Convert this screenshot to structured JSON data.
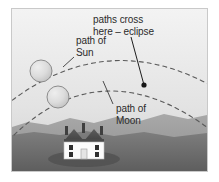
{
  "figure": {
    "title_hidden": "",
    "background_color": "#ffffff",
    "frame_border_color": "#c9c9c9"
  },
  "labels": {
    "eclipse_line1": "paths cross",
    "eclipse_line2": "here – eclipse",
    "sun_line1": "path of",
    "sun_line2": "Sun",
    "moon_line1": "path of",
    "moon_line2": "Moon"
  },
  "scene": {
    "sky_top_color": "#efefef",
    "sky_bottom_color": "#d8d8d8",
    "hills_color": "#9a9a9a",
    "ground_color": "#6f6f6f",
    "house_wall_color": "#fbfbfb",
    "house_roof_color": "#4e4e4e",
    "body_fill_color": "#d6d6d6",
    "body_stroke_color": "#8c8c8c",
    "path_stroke_color": "#5a5a5a",
    "leader_stroke_color": "#1e1e1e",
    "crossing_dot_color": "#151515"
  },
  "bodies": [
    {
      "name": "sun",
      "cx": 29,
      "cy": 62,
      "r": 11
    },
    {
      "name": "moon",
      "cx": 46,
      "cy": 88,
      "r": 11
    }
  ],
  "crossing_point": {
    "x": 132,
    "y": 76
  },
  "arcs": [
    {
      "name": "path-of-sun",
      "d": "M -6 96 Q 95 16 205 80"
    },
    {
      "name": "path-of-moon",
      "d": "M 2 126 Q 92 40 200 122"
    }
  ],
  "leaders": [
    {
      "name": "eclipse-leader",
      "x1": 119,
      "y1": 28,
      "x2": 132,
      "y2": 76
    },
    {
      "name": "sun-leader",
      "x1": 62,
      "y1": 47,
      "x2": 52,
      "y2": 57
    },
    {
      "name": "moon-leader",
      "x1": 101,
      "y1": 95,
      "x2": 91,
      "y2": 72
    }
  ]
}
